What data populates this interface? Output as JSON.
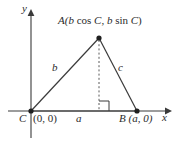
{
  "figure": {
    "axes": {
      "x_label": "x",
      "y_label": "y"
    },
    "labels": {
      "apex_point": "A(",
      "apex_bcos_var": "b",
      "apex_cos": " cos ",
      "apex_angle1": "C",
      "apex_comma": ", ",
      "apex_bsin_var": "b",
      "apex_sin": " sin ",
      "apex_angle2": "C",
      "apex_close": ")",
      "side_b": "b",
      "side_c": "c",
      "base_a": "a",
      "vertex_c": "C",
      "origin_coords": "(0, 0)",
      "vertex_b": "B",
      "vertex_b_coords": "(a, 0)"
    },
    "colors": {
      "stroke": "#3a3a3a",
      "text": "#2b2b2b",
      "background": "#ffffff"
    },
    "geometry": {
      "vertex_c": [
        31,
        111
      ],
      "vertex_b": [
        137,
        111
      ],
      "vertex_a": [
        99,
        38
      ],
      "foot_of_altitude": [
        99,
        111
      ],
      "x_axis": [
        8,
        111,
        168,
        111
      ],
      "y_axis": [
        31,
        137,
        31,
        12
      ]
    }
  }
}
